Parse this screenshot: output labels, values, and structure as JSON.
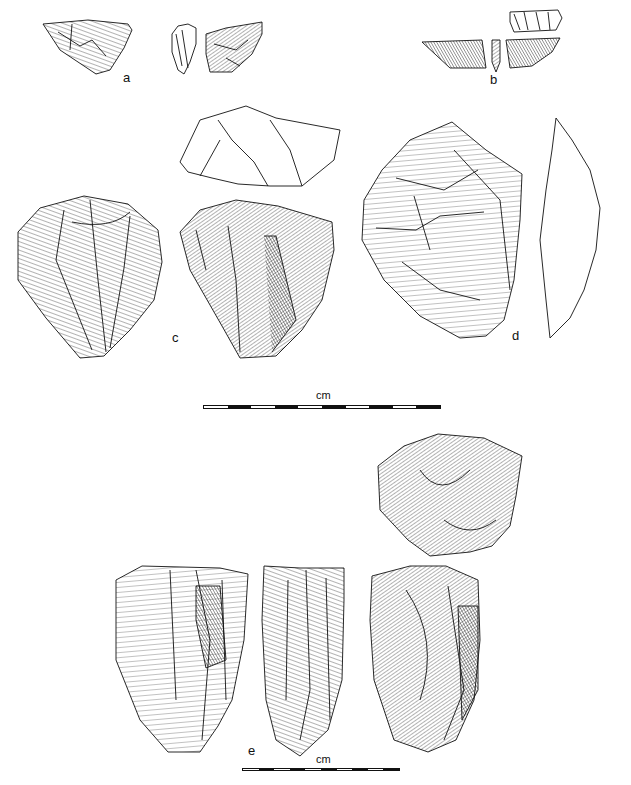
{
  "figure": {
    "type": "lithic artifact illustration plate",
    "background": "#ffffff",
    "ink": "#111111"
  },
  "labels": {
    "a": "a",
    "b": "b",
    "c": "c",
    "d": "d",
    "e": "e"
  },
  "scale_bars": [
    {
      "id": "upper",
      "unit": "cm",
      "segments": 10,
      "pattern": [
        "w",
        "b",
        "w",
        "b",
        "w",
        "b",
        "w",
        "b",
        "w",
        "b"
      ],
      "x": 203,
      "y": 405,
      "width": 238
    },
    {
      "id": "lower",
      "unit": "cm",
      "segments": 10,
      "pattern": [
        "w",
        "b",
        "w",
        "b",
        "w",
        "b",
        "w",
        "b",
        "w",
        "b"
      ],
      "x": 242,
      "y": 768,
      "width": 158
    }
  ],
  "artifacts": [
    {
      "id": "a",
      "views": 3,
      "description": "flake, dorsal / profile / ventral views"
    },
    {
      "id": "b",
      "views": 4,
      "description": "backed bladelet, dorsal / profile / ventral / edge views"
    },
    {
      "id": "c",
      "views": 3,
      "description": "core, platform view above two faces"
    },
    {
      "id": "d",
      "views": 2,
      "description": "bifacial core / handaxe face and outline profile"
    },
    {
      "id": "e",
      "views": 4,
      "description": "prismatic core, platform view above three faces"
    }
  ]
}
